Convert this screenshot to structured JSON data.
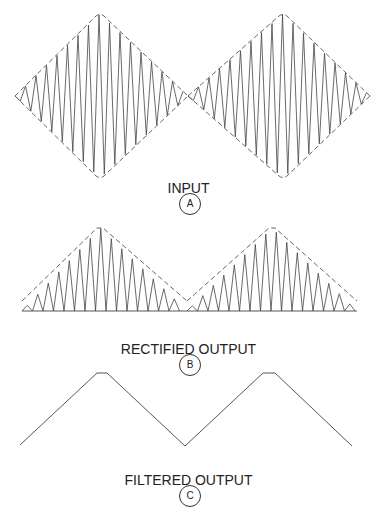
{
  "panels": [
    {
      "id": "A",
      "title": "INPUT",
      "badge": "A",
      "description": "Amplitude-modulated carrier with triangular (diamond) dashed envelope, two lobes"
    },
    {
      "id": "B",
      "title": "RECTIFIED OUTPUT",
      "badge": "B",
      "description": "Half-wave rectified carrier pulses above baseline with dashed triangular envelope"
    },
    {
      "id": "C",
      "title": "FILTERED OUTPUT",
      "badge": "C",
      "description": "Recovered triangular modulating signal with flattened peaks"
    }
  ],
  "colors": {
    "stroke": "#444444",
    "envelope": "#555555",
    "text": "#222222",
    "background": "#ffffff"
  },
  "geometry": {
    "input": {
      "center_y": 96,
      "lobes": [
        {
          "x_start": 15,
          "x_peak": 100,
          "x_end": 188,
          "half_height": 82
        },
        {
          "x_start": 188,
          "x_peak": 283,
          "x_end": 370,
          "half_height": 82
        }
      ],
      "carrier_period": 10.5
    },
    "rectified": {
      "baseline_y": 311,
      "lobes": [
        {
          "x_start": 22,
          "x_peak": 100,
          "x_end": 187,
          "peak_height": 83
        },
        {
          "x_start": 187,
          "x_peak": 272,
          "x_end": 357,
          "peak_height": 83
        }
      ],
      "carrier_period": 10.5
    },
    "filtered": {
      "points": [
        [
          20,
          445
        ],
        [
          97,
          373
        ],
        [
          107,
          373
        ],
        [
          185,
          446
        ],
        [
          263,
          373
        ],
        [
          275,
          373
        ],
        [
          352,
          446
        ]
      ]
    }
  }
}
